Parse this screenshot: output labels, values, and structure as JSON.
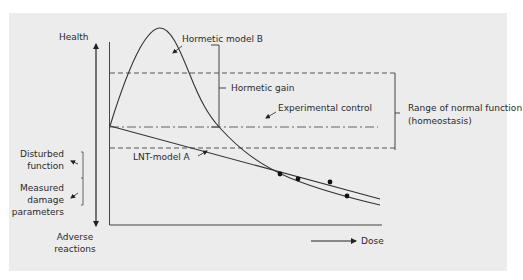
{
  "diagram": {
    "type": "dose-response-diagram",
    "colors": {
      "background": "#ffffff",
      "panel": "#ececec",
      "ink": "#333333"
    },
    "y_axis": {
      "top_label": "Health",
      "bottom_label_line1": "Adverse",
      "bottom_label_line2": "reactions"
    },
    "x_axis": {
      "label": "Dose"
    },
    "left_annotations": {
      "disturbed_line1": "Disturbed",
      "disturbed_line2": "function",
      "measured_line1": "Measured",
      "measured_line2": "damage",
      "measured_line3": "parameters"
    },
    "curves": {
      "hormetic_label": "Hormetic model B",
      "lnt_label": "LNT-model A",
      "control_label": "Experimental control"
    },
    "brackets": {
      "hormetic_gain": "Hormetic gain",
      "range_line1": "Range of normal function",
      "range_line2": "(homeostasis)"
    },
    "data_points": [
      {
        "x": 280,
        "y": 174
      },
      {
        "x": 298,
        "y": 179
      },
      {
        "x": 330,
        "y": 182
      },
      {
        "x": 347,
        "y": 196
      }
    ]
  }
}
